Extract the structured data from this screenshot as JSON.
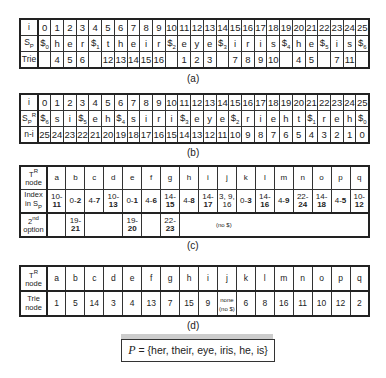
{
  "table_a": {
    "label": "(a)",
    "row_i": {
      "header": "i",
      "cells": [
        "0",
        "1",
        "2",
        "3",
        "4",
        "5",
        "6",
        "7",
        "8",
        "9",
        "10",
        "11",
        "12",
        "13",
        "14",
        "15",
        "16",
        "17",
        "18",
        "19",
        "20",
        "21",
        "22",
        "23",
        "24",
        "25"
      ]
    },
    "row_sp": {
      "header": "Sp",
      "cells": [
        "$0",
        "h",
        "e",
        "r",
        "$1",
        "t",
        "h",
        "e",
        "i",
        "r",
        "$2",
        "e",
        "y",
        "e",
        "$3",
        "i",
        "r",
        "i",
        "s",
        "$4",
        "h",
        "e",
        "$5",
        "i",
        "s",
        "$6"
      ]
    },
    "row_trie": {
      "header": "Trie",
      "cells": [
        "",
        "4",
        "5",
        "6",
        "",
        "12",
        "13",
        "14",
        "15",
        "16",
        "",
        "1",
        "2",
        "3",
        "",
        "7",
        "8",
        "9",
        "10",
        "",
        "4",
        "5",
        "",
        "7",
        "11",
        ""
      ]
    }
  },
  "table_b": {
    "label": "(b)",
    "row_i": {
      "header": "i",
      "cells": [
        "0",
        "1",
        "2",
        "3",
        "4",
        "5",
        "6",
        "7",
        "8",
        "9",
        "10",
        "11",
        "12",
        "13",
        "14",
        "15",
        "16",
        "17",
        "18",
        "19",
        "20",
        "21",
        "22",
        "23",
        "24",
        "25"
      ]
    },
    "row_spr": {
      "header": "SpR",
      "cells": [
        "$6",
        "s",
        "i",
        "$5",
        "e",
        "h",
        "$4",
        "s",
        "i",
        "r",
        "i",
        "$3",
        "e",
        "y",
        "e",
        "$2",
        "r",
        "i",
        "e",
        "h",
        "t",
        "$1",
        "r",
        "e",
        "h",
        "$0"
      ]
    },
    "row_ni": {
      "header": "n-i",
      "cells": [
        "25",
        "24",
        "23",
        "22",
        "21",
        "20",
        "19",
        "18",
        "17",
        "16",
        "15",
        "14",
        "13",
        "12",
        "11",
        "10",
        "9",
        "8",
        "7",
        "6",
        "5",
        "4",
        "3",
        "2",
        "1",
        "0"
      ]
    }
  },
  "table_c": {
    "label": "(c)",
    "header_row": {
      "header": "TR node",
      "cells": [
        "a",
        "b",
        "c",
        "d",
        "e",
        "f",
        "g",
        "h",
        "i",
        "j",
        "k",
        "l",
        "m",
        "n",
        "o",
        "p",
        "q"
      ]
    },
    "index_row": {
      "header": "Index in Sp",
      "cells": [
        {
          "start": "10-",
          "end": "11"
        },
        {
          "start": "0-",
          "end": "2"
        },
        {
          "start": "4-",
          "end": "7"
        },
        {
          "start": "10-",
          "end": "13"
        },
        {
          "start": "0-",
          "end": "1"
        },
        {
          "start": "4-",
          "end": "6"
        },
        {
          "start": "14-",
          "end": "15"
        },
        {
          "start": "4-",
          "end": "8"
        },
        {
          "start": "14-",
          "end": "17"
        },
        {
          "start": "3, 9,",
          "end": "16"
        },
        {
          "start": "0-",
          "end": "3"
        },
        {
          "start": "14-",
          "end": "16"
        },
        {
          "start": "4-",
          "end": "9"
        },
        {
          "start": "22-",
          "end": "24"
        },
        {
          "start": "14-",
          "end": "18"
        },
        {
          "start": "4-",
          "end": "5"
        },
        {
          "start": "10-",
          "end": "12"
        }
      ]
    },
    "second_option_row": {
      "header": "2nd option",
      "cells": [
        {
          "col": "b",
          "start": "19-",
          "end": "21"
        },
        {
          "col": "e",
          "start": "19-",
          "end": "20"
        },
        {
          "col": "g",
          "start": "22-",
          "end": "23"
        }
      ]
    },
    "note": "(no $)"
  },
  "table_d": {
    "label": "(d)",
    "header_row": {
      "header": "TR node",
      "cells": [
        "a",
        "b",
        "c",
        "d",
        "e",
        "f",
        "g",
        "h",
        "i",
        "j",
        "k",
        "l",
        "m",
        "n",
        "o",
        "p",
        "q"
      ]
    },
    "trie_row": {
      "header": "Trie node",
      "cells": [
        "1",
        "5",
        "14",
        "3",
        "4",
        "13",
        "7",
        "15",
        "9",
        "none (no $)",
        "6",
        "8",
        "16",
        "11",
        "10",
        "12",
        "2"
      ]
    }
  },
  "pattern_set": {
    "var": "P",
    "text": "= {her, their, eye, iris, he, is}"
  }
}
